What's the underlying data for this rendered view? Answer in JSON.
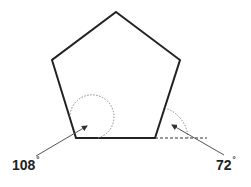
{
  "diagram": {
    "shape": "regular pentagon",
    "labels": {
      "interior_angle": "108",
      "exterior_angle": "72",
      "degree_symbol": "°"
    },
    "colors": {
      "stroke": "#222222",
      "arc": "#888888"
    }
  }
}
